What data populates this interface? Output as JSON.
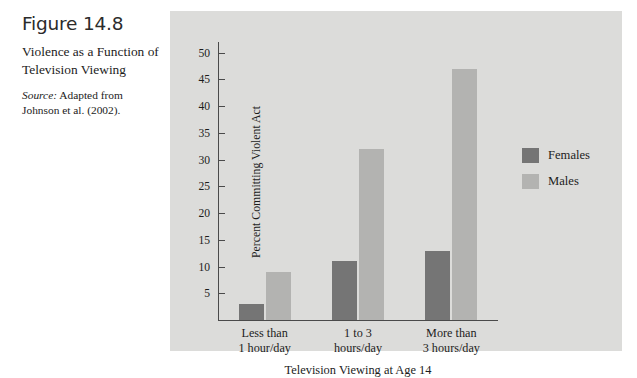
{
  "figure": {
    "number": "Figure 14.8",
    "title": "Violence as a Function of Television Viewing",
    "source_label": "Source:",
    "source_text": " Adapted from Johnson et al. (2002)."
  },
  "chart_data": {
    "type": "bar",
    "title": "",
    "xlabel": "Television Viewing at Age 14",
    "ylabel": "Percent Committing Violent Act",
    "categories": [
      "Less than 1 hour/day",
      "1 to 3 hours/day",
      "More than 3 hours/day"
    ],
    "category_lines": [
      [
        "Less than",
        "1 hour/day"
      ],
      [
        "1 to 3",
        "hours/day"
      ],
      [
        "More than",
        "3 hours/day"
      ]
    ],
    "series": [
      {
        "name": "Females",
        "color": "#757575",
        "values": [
          3,
          11,
          13
        ]
      },
      {
        "name": "Males",
        "color": "#b3b3b1",
        "values": [
          9,
          32,
          47
        ]
      }
    ],
    "ylim": [
      0,
      52
    ],
    "yticks": [
      5,
      10,
      15,
      20,
      25,
      30,
      35,
      40,
      45,
      50
    ],
    "ytick_labels": [
      "5",
      "10",
      "15",
      "20",
      "25",
      "30",
      "35",
      "40",
      "45",
      "50"
    ],
    "grid": false,
    "legend_position": "right",
    "panel_background": "#dcdcda",
    "axis_color": "#4a4a4a"
  }
}
